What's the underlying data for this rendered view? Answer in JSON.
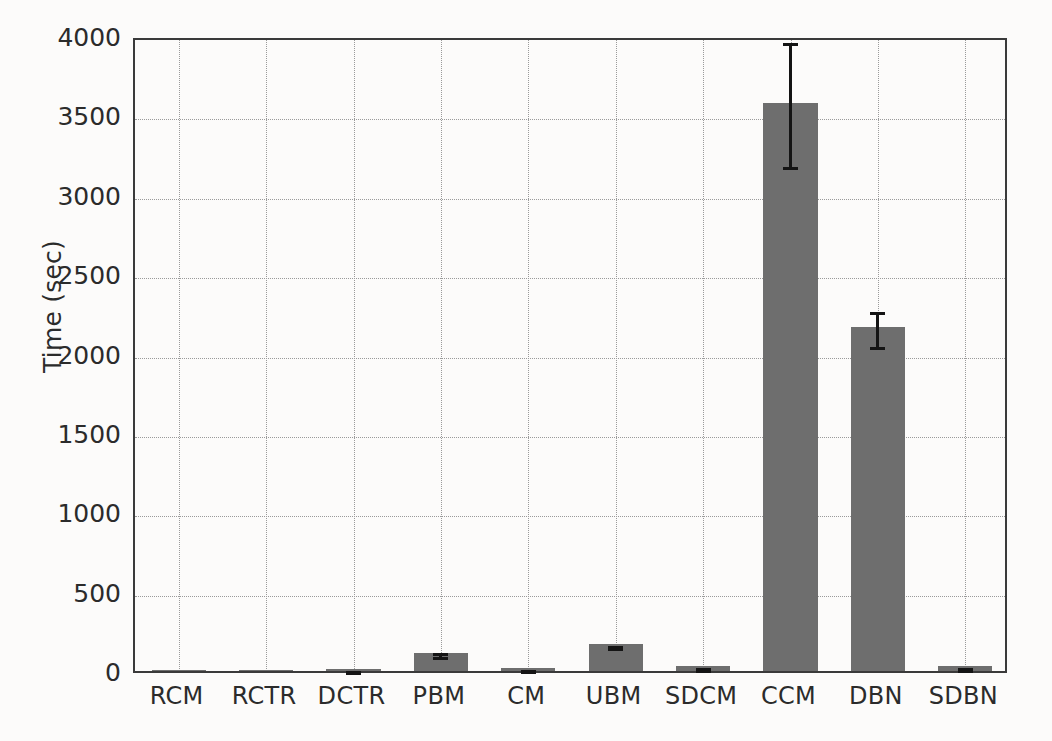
{
  "chart_data": {
    "type": "bar",
    "title": "",
    "xlabel": "",
    "ylabel": "Time (sec)",
    "categories": [
      "RCM",
      "RCTR",
      "DCTR",
      "PBM",
      "CM",
      "UBM",
      "SDCM",
      "CCM",
      "DBN",
      "SDBN"
    ],
    "values": [
      2,
      3,
      12,
      115,
      18,
      168,
      30,
      3580,
      2165,
      30
    ],
    "errors": [
      0,
      0,
      2,
      12,
      4,
      8,
      5,
      390,
      110,
      6
    ],
    "ylim": [
      0,
      4000
    ],
    "yticks": [
      0,
      500,
      1000,
      1500,
      2000,
      2500,
      3000,
      3500,
      4000
    ],
    "ytick_labels": [
      "0",
      "500",
      "1000",
      "1500",
      "2000",
      "2500",
      "3000",
      "3500",
      "4000"
    ],
    "grid": true,
    "grid_style": "dotted",
    "legend": null,
    "bar_color": "#6e6e6e",
    "error_color": "#141414",
    "axis_color": "#3a3a3a",
    "background": "#fcfbfa"
  }
}
